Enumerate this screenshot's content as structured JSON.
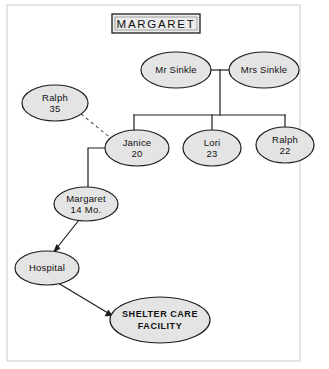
{
  "diagram": {
    "title": "MARGARET",
    "title_box": {
      "x": 112,
      "y": 14,
      "width": 88,
      "height": 19
    },
    "canvas": {
      "width": 329,
      "height": 369
    },
    "frame": {
      "left": 7,
      "top": 5,
      "right": 300,
      "bottom": 361
    },
    "colors": {
      "node_fill": "#e4e4e4",
      "node_stroke": "#1d1d1d",
      "link_stroke": "#1d1d1d",
      "dashed_stroke": "#5a5a5a",
      "frame_stroke": "#c9c9c9",
      "background": "#ffffff",
      "text": "#111111"
    },
    "nodes": [
      {
        "id": "mr-sinkle",
        "name": "Mr Sinkle",
        "sub": "",
        "cx": 176,
        "cy": 70,
        "rx": 35,
        "ry": 18,
        "style": "normal"
      },
      {
        "id": "mrs-sinkle",
        "name": "Mrs Sinkle",
        "sub": "",
        "cx": 264,
        "cy": 70,
        "rx": 35,
        "ry": 18,
        "style": "normal"
      },
      {
        "id": "ralph-35",
        "name": "Ralph",
        "sub": "35",
        "cx": 55,
        "cy": 103,
        "rx": 33,
        "ry": 18,
        "style": "normal"
      },
      {
        "id": "janice-20",
        "name": "Janice",
        "sub": "20",
        "cx": 137,
        "cy": 148,
        "rx": 32,
        "ry": 18,
        "style": "normal"
      },
      {
        "id": "lori-23",
        "name": "Lori",
        "sub": "23",
        "cx": 212,
        "cy": 148,
        "rx": 29,
        "ry": 18,
        "style": "normal"
      },
      {
        "id": "ralph-22",
        "name": "Ralph",
        "sub": "22",
        "cx": 285,
        "cy": 145,
        "rx": 29,
        "ry": 18,
        "style": "normal"
      },
      {
        "id": "margaret-14",
        "name": "Margaret",
        "sub": "14 Mo.",
        "cx": 86,
        "cy": 204,
        "rx": 32,
        "ry": 17,
        "style": "normal"
      },
      {
        "id": "hospital",
        "name": "Hospital",
        "sub": "",
        "cx": 47,
        "cy": 268,
        "rx": 32,
        "ry": 17,
        "style": "normal"
      },
      {
        "id": "shelter",
        "name": "SHELTER CARE",
        "sub": "FACILITY",
        "cx": 160,
        "cy": 320,
        "rx": 50,
        "ry": 23,
        "style": "caps"
      }
    ],
    "edges": [
      {
        "id": "marriage-bar",
        "from": "mr-sinkle",
        "to": "mrs-sinkle",
        "type": "solid",
        "label": "marriage line"
      },
      {
        "id": "sibling-drop",
        "from": "marriage",
        "to": "sibling-bar",
        "type": "solid",
        "label": "descent line"
      },
      {
        "id": "sibling-janice",
        "from": "sibling-bar",
        "to": "janice-20",
        "type": "solid",
        "label": "child link"
      },
      {
        "id": "sibling-lori",
        "from": "sibling-bar",
        "to": "lori-23",
        "type": "solid",
        "label": "child link"
      },
      {
        "id": "sibling-ralph",
        "from": "sibling-bar",
        "to": "ralph-22",
        "type": "solid",
        "label": "child link"
      },
      {
        "id": "ralph-janice",
        "from": "ralph-35",
        "to": "janice-20",
        "type": "dashed",
        "label": "partner link"
      },
      {
        "id": "janice-margaret",
        "from": "janice-20",
        "to": "margaret-14",
        "type": "elbow",
        "label": "child link"
      },
      {
        "id": "margaret-hospital",
        "from": "margaret-14",
        "to": "hospital",
        "type": "arrow",
        "label": "placement"
      },
      {
        "id": "hospital-shelter",
        "from": "hospital",
        "to": "shelter",
        "type": "arrow",
        "label": "placement"
      }
    ]
  }
}
